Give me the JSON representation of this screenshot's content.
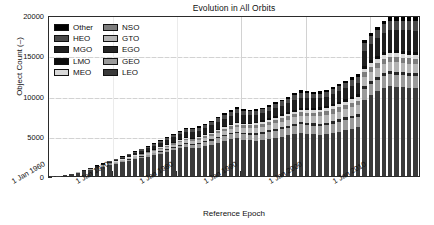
{
  "chart_data": {
    "type": "bar",
    "stacked": true,
    "title": "Evolution in All Orbits",
    "xlabel": "Reference Epoch",
    "ylabel": "Object Count (–)",
    "ylim": [
      0,
      20000
    ],
    "ytick_labels": [
      "0",
      "5000",
      "10000",
      "15000",
      "20000"
    ],
    "ytick_values": [
      0,
      5000,
      10000,
      15000,
      20000
    ],
    "xtick_labels": [
      "1 Jan 1960",
      "1 Jan 1970",
      "1 Jan 1980",
      "1 Jan 1990",
      "1 Jan 2000",
      "1 Jan 2010"
    ],
    "xtick_values": [
      1960,
      1970,
      1980,
      1990,
      2000,
      2010
    ],
    "xlim": [
      1960,
      2018
    ],
    "grid": true,
    "legend_position": "upper left",
    "legend_columns": 2,
    "series": [
      {
        "name": "LEO",
        "color": "#3a3a3a",
        "values": [
          20,
          60,
          150,
          260,
          420,
          600,
          800,
          1000,
          1180,
          1360,
          1520,
          1700,
          1880,
          2060,
          2220,
          2380,
          2560,
          2760,
          2960,
          3180,
          3420,
          3560,
          3420,
          3520,
          3700,
          3900,
          4150,
          4380,
          4560,
          4700,
          4520,
          4420,
          4380,
          4460,
          4620,
          4760,
          4900,
          5060,
          5260,
          5400,
          5260,
          5180,
          5120,
          5180,
          5320,
          5500,
          5700,
          5880,
          6060,
          9500,
          10100,
          10500,
          10900,
          11300,
          11500,
          11900,
          12200,
          12500
        ]
      },
      {
        "name": "GEO",
        "color": "#9a9a9a",
        "values": [
          0,
          0,
          0,
          6,
          12,
          20,
          30,
          45,
          60,
          75,
          95,
          115,
          140,
          165,
          190,
          215,
          245,
          275,
          305,
          335,
          365,
          395,
          420,
          450,
          480,
          510,
          545,
          580,
          615,
          650,
          685,
          720,
          755,
          790,
          825,
          860,
          895,
          930,
          965,
          1000,
          1035,
          1070,
          1105,
          1140,
          1175,
          1210,
          1245,
          1280,
          1315,
          1350,
          1390,
          1430,
          1470,
          1510,
          1550,
          1590,
          1630,
          1670
        ]
      },
      {
        "name": "EGO",
        "color": "#262626",
        "values": [
          0,
          0,
          0,
          2,
          4,
          7,
          10,
          14,
          18,
          23,
          28,
          34,
          40,
          46,
          53,
          60,
          68,
          76,
          84,
          92,
          100,
          108,
          116,
          124,
          132,
          140,
          149,
          158,
          167,
          176,
          185,
          194,
          203,
          212,
          221,
          230,
          239,
          248,
          257,
          266,
          275,
          284,
          293,
          302,
          311,
          320,
          329,
          338,
          347,
          356,
          365,
          374,
          383,
          392,
          401,
          410,
          419,
          428
        ]
      },
      {
        "name": "GTO",
        "color": "#b5b5b5",
        "values": [
          0,
          2,
          5,
          10,
          18,
          28,
          40,
          55,
          70,
          88,
          106,
          126,
          146,
          168,
          190,
          212,
          236,
          260,
          284,
          308,
          332,
          356,
          380,
          404,
          428,
          452,
          478,
          504,
          530,
          556,
          582,
          608,
          634,
          660,
          686,
          712,
          738,
          764,
          790,
          816,
          842,
          868,
          894,
          920,
          946,
          972,
          998,
          1024,
          1050,
          1076,
          1102,
          1128,
          1154,
          1180,
          1206,
          1232,
          1258,
          1284
        ]
      },
      {
        "name": "NSO",
        "color": "#7d7d7d",
        "values": [
          0,
          1,
          3,
          6,
          10,
          16,
          22,
          30,
          38,
          47,
          56,
          66,
          77,
          88,
          100,
          112,
          125,
          138,
          151,
          164,
          178,
          192,
          206,
          220,
          234,
          248,
          263,
          278,
          293,
          308,
          323,
          338,
          353,
          368,
          383,
          398,
          413,
          428,
          443,
          458,
          473,
          488,
          503,
          518,
          533,
          548,
          563,
          578,
          593,
          608,
          623,
          638,
          653,
          668,
          683,
          698,
          713,
          728
        ]
      },
      {
        "name": "MEO",
        "color": "#d8d8d8",
        "values": [
          0,
          0,
          1,
          2,
          4,
          6,
          9,
          12,
          16,
          20,
          25,
          30,
          36,
          42,
          48,
          55,
          62,
          70,
          78,
          86,
          95,
          104,
          113,
          122,
          132,
          142,
          152,
          163,
          174,
          185,
          196,
          208,
          220,
          232,
          244,
          256,
          268,
          281,
          294,
          307,
          320,
          333,
          346,
          359,
          372,
          385,
          398,
          411,
          424,
          437,
          450,
          463,
          476,
          489,
          502,
          515,
          528,
          541
        ]
      },
      {
        "name": "LMO",
        "color": "#0d0d0d",
        "values": [
          0,
          0,
          1,
          2,
          3,
          5,
          7,
          10,
          13,
          16,
          20,
          24,
          28,
          33,
          38,
          43,
          49,
          55,
          61,
          67,
          74,
          81,
          88,
          95,
          103,
          111,
          119,
          127,
          136,
          145,
          154,
          163,
          173,
          183,
          193,
          203,
          213,
          224,
          235,
          246,
          257,
          268,
          280,
          292,
          304,
          316,
          328,
          340,
          353,
          366,
          379,
          392,
          405,
          418,
          432,
          446,
          460,
          474
        ]
      },
      {
        "name": "MGO",
        "color": "#1f1f1f",
        "values": [
          0,
          2,
          6,
          14,
          26,
          42,
          62,
          86,
          112,
          142,
          175,
          210,
          248,
          288,
          330,
          374,
          420,
          468,
          518,
          570,
          624,
          680,
          700,
          720,
          760,
          810,
          870,
          940,
          1010,
          1080,
          980,
          930,
          900,
          920,
          960,
          1010,
          1060,
          1120,
          1180,
          1240,
          1190,
          1150,
          1130,
          1160,
          1210,
          1270,
          1330,
          1390,
          1450,
          1900,
          2050,
          2200,
          2350,
          2500,
          2600,
          2750,
          2900,
          3050
        ]
      },
      {
        "name": "HEO",
        "color": "#4a4a4a",
        "values": [
          0,
          1,
          3,
          7,
          13,
          21,
          31,
          43,
          56,
          71,
          87,
          105,
          124,
          144,
          165,
          187,
          210,
          234,
          259,
          285,
          312,
          340,
          352,
          364,
          385,
          410,
          440,
          472,
          505,
          538,
          500,
          478,
          465,
          475,
          495,
          520,
          548,
          578,
          608,
          640,
          616,
          596,
          586,
          600,
          625,
          655,
          686,
          718,
          750,
          880,
          940,
          1000,
          1060,
          1120,
          1160,
          1220,
          1280,
          1340
        ]
      },
      {
        "name": "Other",
        "color": "#000000",
        "values": [
          0,
          0,
          1,
          2,
          4,
          7,
          11,
          16,
          21,
          27,
          34,
          41,
          49,
          57,
          66,
          75,
          85,
          95,
          106,
          117,
          129,
          141,
          147,
          153,
          162,
          173,
          186,
          200,
          214,
          228,
          212,
          203,
          198,
          203,
          212,
          223,
          235,
          248,
          261,
          275,
          265,
          256,
          252,
          258,
          269,
          282,
          295,
          309,
          323,
          380,
          406,
          432,
          458,
          484,
          502,
          528,
          554,
          580
        ]
      }
    ],
    "legend_order_column_1": [
      "Other",
      "HEO",
      "MGO",
      "LMO",
      "MEO"
    ],
    "legend_order_column_2": [
      "NSO",
      "GTO",
      "EGO",
      "GEO",
      "LEO"
    ]
  },
  "colors": {
    "axis": "#2b2b2b",
    "grid": "#d2d2d2",
    "background": "#ffffff",
    "text": "#111111"
  }
}
